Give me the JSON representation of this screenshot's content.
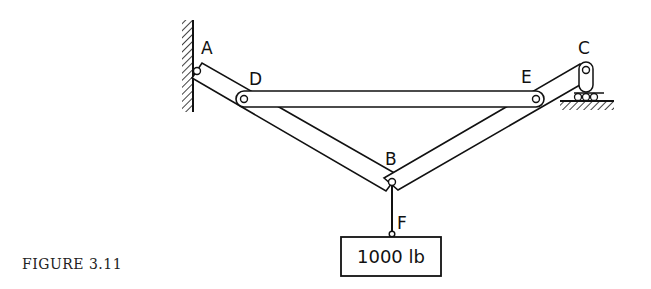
{
  "figure": {
    "caption": "FIGURE 3.11",
    "labels": {
      "A": "A",
      "B": "B",
      "C": "C",
      "D": "D",
      "E": "E",
      "F": "F"
    },
    "load": "1000 lb",
    "supports": {
      "A": "fixed-wall-pin",
      "C": "roller-support"
    },
    "members": [
      "A-B",
      "D-E",
      "B-C"
    ],
    "colors": {
      "line": "#111111",
      "background": "#ffffff"
    }
  }
}
